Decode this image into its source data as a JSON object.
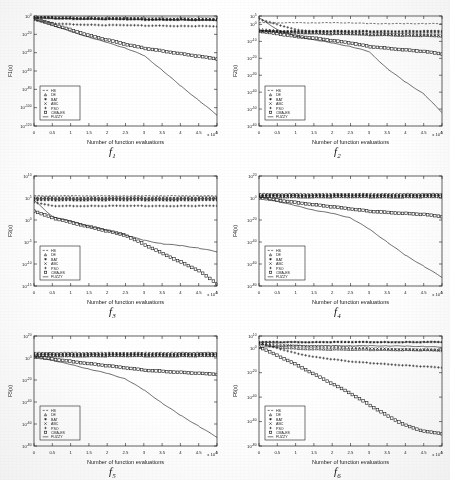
{
  "figure": {
    "type": "multi-panel-convergence-figure",
    "rows": 3,
    "cols": 2,
    "background": "#ffffff",
    "line_color": "#1a1a1a"
  },
  "common": {
    "xlabel": "Number of function evaluations",
    "x_multiplier": "x 10",
    "x_multiplier_exp": "4",
    "xticklabels": [
      "0",
      "0.5",
      "1",
      "1.5",
      "2",
      "2.5",
      "3",
      "3.5",
      "4",
      "4.5",
      "5"
    ],
    "xlim": [
      0,
      5
    ],
    "grid": "off",
    "legend_position": "lower-left",
    "legend_entries": [
      {
        "label": "HS",
        "marker": "dashed-line"
      },
      {
        "label": "DE",
        "marker": "triangle"
      },
      {
        "label": "BAT",
        "marker": "asterisk"
      },
      {
        "label": "ABC",
        "marker": "cross-x"
      },
      {
        "label": "PSO",
        "marker": "plus"
      },
      {
        "label": "CMA-ES",
        "marker": "square"
      },
      {
        "label": "FUZZY",
        "marker": "solid-line"
      }
    ]
  },
  "chart_data": [
    {
      "id": "f1",
      "type": "line",
      "panel_label": "f",
      "panel_sub": "1",
      "title": "",
      "xlabel": "Number of function evaluations",
      "ylabel": "F1(x)",
      "x_multiplier": "x 10",
      "x_multiplier_exp": "4",
      "xlim": [
        0,
        5
      ],
      "ylim_exp": [
        -120,
        0
      ],
      "yticklabels": [
        "10^0",
        "10^-20",
        "10^-40",
        "10^-60",
        "10^-80",
        "10^-100",
        "10^-120"
      ],
      "ytick_exponents": [
        0,
        -20,
        -40,
        -60,
        -80,
        -100,
        -120
      ],
      "x": [
        0,
        0.5,
        1,
        1.5,
        2,
        2.5,
        3,
        3.5,
        4,
        4.5,
        5
      ],
      "series": [
        {
          "name": "HS",
          "marker": "dashed-line",
          "exponents": [
            -2,
            -3,
            -3,
            -3.5,
            -3.5,
            -4,
            -4,
            -4,
            -4.5,
            -4.5,
            -5
          ]
        },
        {
          "name": "DE",
          "marker": "triangle",
          "exponents": [
            -1,
            -1.5,
            -2,
            -2,
            -2.5,
            -2.5,
            -3,
            -3,
            -3,
            -3.5,
            -3.5
          ]
        },
        {
          "name": "BAT",
          "marker": "asterisk",
          "exponents": [
            -2,
            -2.5,
            -3,
            -3,
            -3.5,
            -3.5,
            -4,
            -4,
            -4,
            -4.5,
            -4.5
          ]
        },
        {
          "name": "ABC",
          "marker": "cross-x",
          "exponents": [
            -1,
            -1.5,
            -2,
            -2,
            -2.5,
            -2.5,
            -2.5,
            -3,
            -3,
            -3,
            -3.5
          ]
        },
        {
          "name": "PSO",
          "marker": "plus",
          "exponents": [
            -4,
            -8,
            -9,
            -9.5,
            -10,
            -10,
            -10.5,
            -10.5,
            -11,
            -11,
            -11.5
          ]
        },
        {
          "name": "CMA-ES",
          "marker": "square",
          "exponents": [
            -3,
            -9,
            -15,
            -21,
            -26,
            -31,
            -35,
            -38,
            -41,
            -44,
            -47
          ]
        },
        {
          "name": "FUZZY",
          "marker": "solid-line",
          "exponents": [
            -4,
            -10,
            -17,
            -23,
            -29,
            -35,
            -43,
            -59,
            -76,
            -92,
            -108
          ]
        }
      ]
    },
    {
      "id": "f2",
      "type": "line",
      "panel_label": "f",
      "panel_sub": "2",
      "title": "",
      "xlabel": "Number of function evaluations",
      "ylabel": "F2(x)",
      "x_multiplier": "x 10",
      "x_multiplier_exp": "4",
      "xlim": [
        0,
        5
      ],
      "ylim_exp": [
        -60,
        5
      ],
      "yticklabels": [
        "10^5",
        "10^0",
        "10^-10",
        "10^-20",
        "10^-30",
        "10^-40",
        "10^-50",
        "10^-60"
      ],
      "ytick_exponents": [
        5,
        0,
        -10,
        -20,
        -30,
        -40,
        -50,
        -60
      ],
      "x": [
        0,
        0.5,
        1,
        1.5,
        2,
        2.5,
        3,
        3.5,
        4,
        4.5,
        5
      ],
      "series": [
        {
          "name": "HS",
          "marker": "dashed-line",
          "exponents": [
            1,
            1,
            1,
            1,
            1,
            1,
            0.5,
            0.5,
            0.5,
            0.5,
            0.5
          ]
        },
        {
          "name": "DE",
          "marker": "triangle",
          "exponents": [
            -3,
            -4,
            -4.5,
            -5,
            -5.5,
            -5.5,
            -6,
            -6,
            -6.5,
            -6.5,
            -7
          ]
        },
        {
          "name": "BAT",
          "marker": "asterisk",
          "exponents": [
            -4,
            -4,
            -4,
            -4,
            -4,
            -4,
            -4,
            -4,
            -4,
            -4,
            -4
          ]
        },
        {
          "name": "ABC",
          "marker": "cross-x",
          "exponents": [
            -4,
            -4.5,
            -5,
            -5,
            -5.5,
            -5.5,
            -6,
            -6,
            -6,
            -6.5,
            -6.5
          ]
        },
        {
          "name": "PSO",
          "marker": "plus",
          "exponents": [
            3,
            0,
            -3,
            -4,
            -4,
            -4.5,
            -4.5,
            -5,
            -5,
            -5,
            -5
          ]
        },
        {
          "name": "CMA-ES",
          "marker": "square",
          "exponents": [
            -4,
            -5.5,
            -7,
            -8,
            -9.5,
            -11,
            -13,
            -14,
            -15,
            -16,
            -17.5
          ]
        },
        {
          "name": "FUZZY",
          "marker": "solid-line",
          "exponents": [
            4,
            -3,
            -7,
            -9,
            -11,
            -13,
            -16,
            -26,
            -34,
            -41,
            -52
          ]
        }
      ]
    },
    {
      "id": "f3",
      "type": "line",
      "panel_label": "f",
      "panel_sub": "3",
      "title": "",
      "xlabel": "Number of function evaluations",
      "ylabel": "F3(x)",
      "x_multiplier": "x 10",
      "x_multiplier_exp": "4",
      "xlim": [
        0,
        5
      ],
      "ylim_exp": [
        -15,
        10
      ],
      "yticklabels": [
        "10^10",
        "10^5",
        "10^0",
        "10^-5",
        "10^-10",
        "10^-15"
      ],
      "ytick_exponents": [
        10,
        5,
        0,
        -5,
        -10,
        -15
      ],
      "x": [
        0,
        0.5,
        1,
        1.5,
        2,
        2.5,
        3,
        3.5,
        4,
        4.5,
        5
      ],
      "series": [
        {
          "name": "HS",
          "marker": "dashed-line",
          "exponents": [
            5.5,
            5.5,
            5.5,
            5.5,
            5.5,
            5.5,
            5.5,
            5.5,
            5.5,
            5.5,
            5.5
          ]
        },
        {
          "name": "DE",
          "marker": "triangle",
          "exponents": [
            5,
            5,
            5,
            5,
            5,
            5,
            5,
            5,
            5,
            5,
            5
          ]
        },
        {
          "name": "BAT",
          "marker": "asterisk",
          "exponents": [
            4.5,
            4.5,
            4.5,
            4.5,
            4.5,
            4.5,
            4.5,
            4.5,
            4.5,
            4.5,
            4.5
          ]
        },
        {
          "name": "ABC",
          "marker": "cross-x",
          "exponents": [
            5,
            5,
            5,
            5,
            5,
            5,
            5,
            5,
            5,
            5,
            5
          ]
        },
        {
          "name": "PSO",
          "marker": "plus",
          "exponents": [
            4,
            3.2,
            3.2,
            3.2,
            3.2,
            3.2,
            3.2,
            3.2,
            3.2,
            3.2,
            3.2
          ]
        },
        {
          "name": "CMA-ES",
          "marker": "square",
          "exponents": [
            2,
            0.5,
            -0.5,
            -1.5,
            -2.5,
            -3.5,
            -5.5,
            -7.5,
            -9.5,
            -11.5,
            -14.5
          ]
        },
        {
          "name": "FUZZY",
          "marker": "solid-line",
          "exponents": [
            4.5,
            0.8,
            -0.3,
            -1.4,
            -2.4,
            -3.4,
            -4.6,
            -5.4,
            -5.8,
            -6.4,
            -7.2
          ]
        }
      ]
    },
    {
      "id": "f4",
      "type": "line",
      "panel_label": "f",
      "panel_sub": "4",
      "title": "",
      "xlabel": "Number of function evaluations",
      "ylabel": "F4(x)",
      "x_multiplier": "x 10",
      "x_multiplier_exp": "4",
      "xlim": [
        0,
        5
      ],
      "ylim_exp": [
        -80,
        20
      ],
      "yticklabels": [
        "10^20",
        "10^0",
        "10^-20",
        "10^-40",
        "10^-60",
        "10^-80"
      ],
      "ytick_exponents": [
        20,
        0,
        -20,
        -40,
        -60,
        -80
      ],
      "x": [
        0,
        0.5,
        1,
        1.5,
        2,
        2.5,
        3,
        3.5,
        4,
        4.5,
        5
      ],
      "series": [
        {
          "name": "HS",
          "marker": "dashed-line",
          "exponents": [
            4,
            4,
            4,
            4,
            4,
            4,
            4,
            4,
            4,
            4,
            4
          ]
        },
        {
          "name": "DE",
          "marker": "triangle",
          "exponents": [
            1.5,
            1,
            1,
            1,
            1,
            1,
            1,
            1,
            1,
            1,
            1
          ]
        },
        {
          "name": "BAT",
          "marker": "asterisk",
          "exponents": [
            3,
            3,
            3,
            3,
            3,
            3,
            3,
            3,
            3,
            3,
            3
          ]
        },
        {
          "name": "ABC",
          "marker": "cross-x",
          "exponents": [
            1.5,
            1.2,
            1.2,
            1.2,
            1.2,
            1.2,
            1.2,
            1.2,
            1.2,
            1.2,
            1.2
          ]
        },
        {
          "name": "PSO",
          "marker": "plus",
          "exponents": [
            2,
            2,
            2,
            2,
            2,
            2,
            2,
            2,
            2,
            2,
            2
          ]
        },
        {
          "name": "CMA-ES",
          "marker": "square",
          "exponents": [
            0,
            -2,
            -4,
            -6,
            -8,
            -10,
            -12,
            -13,
            -14,
            -15,
            -17
          ]
        },
        {
          "name": "FUZZY",
          "marker": "solid-line",
          "exponents": [
            1,
            -3,
            -7,
            -11,
            -14,
            -18,
            -28,
            -40,
            -52,
            -62,
            -72
          ]
        }
      ]
    },
    {
      "id": "f5",
      "type": "line",
      "panel_label": "f",
      "panel_sub": "5",
      "title": "",
      "xlabel": "Number of function evaluations",
      "ylabel": "F5(x)",
      "x_multiplier": "x 10",
      "x_multiplier_exp": "4",
      "xlim": [
        0,
        5
      ],
      "ylim_exp": [
        -80,
        20
      ],
      "yticklabels": [
        "10^20",
        "10^0",
        "10^-20",
        "10^-40",
        "10^-60",
        "10^-80"
      ],
      "ytick_exponents": [
        20,
        0,
        -20,
        -40,
        -60,
        -80
      ],
      "x": [
        0,
        0.5,
        1,
        1.5,
        2,
        2.5,
        3,
        3.5,
        4,
        4.5,
        5
      ],
      "series": [
        {
          "name": "HS",
          "marker": "dashed-line",
          "exponents": [
            5,
            5,
            5,
            5,
            5,
            5,
            5,
            5,
            5,
            5,
            5
          ]
        },
        {
          "name": "DE",
          "marker": "triangle",
          "exponents": [
            2,
            2,
            2,
            2,
            2,
            2,
            2,
            2,
            2,
            2,
            2
          ]
        },
        {
          "name": "BAT",
          "marker": "asterisk",
          "exponents": [
            4,
            4,
            4,
            4,
            4,
            4,
            4,
            4,
            4,
            4,
            4
          ]
        },
        {
          "name": "ABC",
          "marker": "cross-x",
          "exponents": [
            2,
            2,
            2,
            2,
            2,
            2,
            2,
            2,
            2,
            2,
            2
          ]
        },
        {
          "name": "PSO",
          "marker": "plus",
          "exponents": [
            3,
            3,
            3,
            3,
            3,
            3,
            3,
            3,
            3,
            3,
            3
          ]
        },
        {
          "name": "CMA-ES",
          "marker": "square",
          "exponents": [
            1,
            -1,
            -3,
            -5,
            -7,
            -9,
            -11,
            -12,
            -13,
            -14,
            -15
          ]
        },
        {
          "name": "FUZZY",
          "marker": "solid-line",
          "exponents": [
            1,
            -2,
            -6,
            -10,
            -14,
            -19,
            -29,
            -41,
            -52,
            -62,
            -72
          ]
        }
      ]
    },
    {
      "id": "f6",
      "type": "line",
      "panel_label": "f",
      "panel_sub": "6",
      "title": "",
      "xlabel": "Number of function evaluations",
      "ylabel": "F6(x)",
      "x_multiplier": "x 10",
      "x_multiplier_exp": "4",
      "xlim": [
        0,
        5
      ],
      "ylim_exp": [
        -80,
        10
      ],
      "yticklabels": [
        "10^10",
        "10^0",
        "10^-20",
        "10^-40",
        "10^-60",
        "10^-80"
      ],
      "ytick_exponents": [
        10,
        0,
        -20,
        -40,
        -60,
        -80
      ],
      "x": [
        0,
        0.5,
        1,
        1.5,
        2,
        2.5,
        3,
        3.5,
        4,
        4.5,
        5
      ],
      "series": [
        {
          "name": "HS",
          "marker": "dashed-line",
          "exponents": [
            5,
            5,
            5,
            5,
            5,
            5,
            5,
            5,
            5,
            5,
            5
          ]
        },
        {
          "name": "DE",
          "marker": "triangle",
          "exponents": [
            4,
            1,
            0,
            -0.5,
            -0.8,
            -1,
            -1,
            -1,
            -1.2,
            -1.2,
            -1.5
          ]
        },
        {
          "name": "BAT",
          "marker": "asterisk",
          "exponents": [
            5,
            5,
            5,
            5,
            5,
            5,
            5,
            5,
            5,
            5,
            5
          ]
        },
        {
          "name": "ABC",
          "marker": "cross-x",
          "exponents": [
            4,
            3,
            2,
            1.5,
            1,
            0.5,
            0,
            -0.5,
            -1,
            -1.5,
            -2
          ]
        },
        {
          "name": "PSO",
          "marker": "plus",
          "exponents": [
            4,
            0,
            -4,
            -7,
            -9,
            -11,
            -12,
            -13,
            -14,
            -15,
            -16
          ]
        },
        {
          "name": "CMA-ES",
          "marker": "square",
          "exponents": [
            1,
            -6,
            -13,
            -21,
            -29,
            -37,
            -46,
            -55,
            -63,
            -68,
            -70
          ]
        },
        {
          "name": "FUZZY",
          "marker": "solid-line",
          "exponents": [
            0.5,
            1.8,
            2.0,
            2.0,
            2.0,
            2.0,
            2.0,
            1.9,
            1.7,
            1.4,
            0.9
          ]
        }
      ]
    }
  ]
}
